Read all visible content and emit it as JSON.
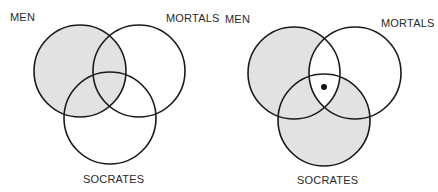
{
  "colors": {
    "shade": "#e2e2e2",
    "stroke": "#1a1a1a",
    "background": "#ffffff",
    "dot": "#111111"
  },
  "diagrams": [
    {
      "id": "premise-diagram",
      "labels": {
        "men": "MEN",
        "mortals": "MORTALS",
        "socrates": "SOCRATES"
      },
      "circles": {
        "men": {
          "cx": 80,
          "cy": 71,
          "r": 46
        },
        "mortals": {
          "cx": 139,
          "cy": 71,
          "r": 46
        },
        "socrates": {
          "cx": 110,
          "cy": 118,
          "r": 46
        }
      },
      "shaded_regions": [
        "men-only",
        "men-and-mortals",
        "men-and-socrates",
        "all-three"
      ],
      "marker": null
    },
    {
      "id": "conclusion-diagram",
      "labels": {
        "men": "MEN",
        "mortals": "MORTALS",
        "socrates": "SOCRATES"
      },
      "circles": {
        "men": {
          "cx": 294,
          "cy": 73,
          "r": 46
        },
        "mortals": {
          "cx": 355,
          "cy": 73,
          "r": 46
        },
        "socrates": {
          "cx": 324,
          "cy": 120,
          "r": 46
        }
      },
      "shaded_regions": [
        "men-only",
        "men-and-socrates",
        "socrates-only",
        "socrates-and-mortals"
      ],
      "marker": {
        "cx": 324,
        "cy": 87,
        "r": 3
      }
    }
  ]
}
